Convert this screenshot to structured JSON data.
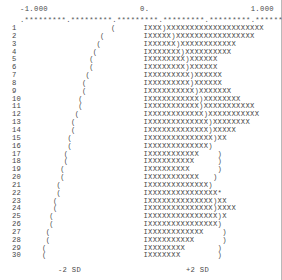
{
  "plot": {
    "type": "ascii-confidence-interval-plot",
    "row_count": 30,
    "char_unit_px": 3.62,
    "scale": {
      "left_label": "-1.000",
      "center_label": "0.",
      "right_label": "1.000",
      "axis_ruler": ".*********.*********.*********.*********.*********.*********.",
      "min": -1.0,
      "max": 1.0,
      "center": 0.0
    },
    "footer": {
      "left_label": "-2 SD",
      "right_label": "+2 SD"
    },
    "glyphs": {
      "bar_fill": "X",
      "bar_start": "I",
      "upper_bound": ")",
      "lower_bound": "(",
      "outlier_marker": "*",
      "ruler_tick": "*",
      "ruler_major": "."
    },
    "rows": [
      {
        "n": "1",
        "paren_col": 24,
        "bar": "IXXX)XXXXXXXXXXXXXXXXXXXXX"
      },
      {
        "n": "2",
        "paren_col": 21,
        "bar": "IXXXXX)XXXXXXXXXXXXXXXXX"
      },
      {
        "n": "3",
        "paren_col": 20,
        "bar": "IXXXXXX)XXXXXXXXXXXX"
      },
      {
        "n": "4",
        "paren_col": 19,
        "bar": "IXXXXXXX)XXXXXXXXXX"
      },
      {
        "n": "5",
        "paren_col": 18,
        "bar": "IXXXXXXXX)XXXXXX"
      },
      {
        "n": "6",
        "paren_col": 18,
        "bar": "IXXXXXXXX)XXXXXX"
      },
      {
        "n": "7",
        "paren_col": 17,
        "bar": "IXXXXXXXXX)XXXXXX"
      },
      {
        "n": "8",
        "paren_col": 16,
        "bar": "IXXXXXXXXX)XXXXXX"
      },
      {
        "n": "9",
        "paren_col": 16,
        "bar": "IXXXXXXXXXX)XXXXXXX"
      },
      {
        "n": "10",
        "paren_col": 15,
        "bar": "IXXXXXXXXXXX)XXXXXXXX"
      },
      {
        "n": "11",
        "paren_col": 15,
        "bar": "IXXXXXXXXXXX)XXXXXXXXXXX"
      },
      {
        "n": "12",
        "paren_col": 14,
        "bar": "IXXXXXXXXXXXX)XXXXXXXXXXX"
      },
      {
        "n": "13",
        "paren_col": 13,
        "bar": "IXXXXXXXXXXXXX)XXXXXXXX"
      },
      {
        "n": "14",
        "paren_col": 13,
        "bar": "IXXXXXXXXXXXXX)XXXXX"
      },
      {
        "n": "15",
        "paren_col": 12,
        "bar": "IXXXXXXXXXXXXXX)XX"
      },
      {
        "n": "16",
        "paren_col": 12,
        "bar": "IXXXXXXXXXXXXX)"
      },
      {
        "n": "17",
        "paren_col": 11,
        "bar": "IXXXXXXXXXXX    )"
      },
      {
        "n": "18",
        "paren_col": 11,
        "bar": "IXXXXXXXXXX     )"
      },
      {
        "n": "19",
        "paren_col": 10,
        "bar": "IXXXXXXXXX      )"
      },
      {
        "n": "20",
        "paren_col": 10,
        "bar": "IXXXXXXXXXXX   )"
      },
      {
        "n": "21",
        "paren_col": 9,
        "bar": "IXXXXXXXXXXXXX)"
      },
      {
        "n": "22",
        "paren_col": 9,
        "bar": "IXXXXXXXXXXXXXXX*"
      },
      {
        "n": "23",
        "paren_col": 8,
        "bar": "IXXXXXXXXXXXXXX)XX"
      },
      {
        "n": "24",
        "paren_col": 8,
        "bar": "IXXXXXXXXXXXXXX)XXXX"
      },
      {
        "n": "25",
        "paren_col": 7,
        "bar": "IXXXXXXXXXXXXXXX)X"
      },
      {
        "n": "26",
        "paren_col": 7,
        "bar": "IXXXXXXXXXXXXXXX)"
      },
      {
        "n": "27",
        "paren_col": 6,
        "bar": "IXXXXXXXXXXXX    )"
      },
      {
        "n": "28",
        "paren_col": 6,
        "bar": "IXXXXXXXXXX      )"
      },
      {
        "n": "29",
        "paren_col": 5,
        "bar": "IXXXXXXXX       )"
      },
      {
        "n": "30",
        "paren_col": 5,
        "bar": "IXXXXXXX        )"
      }
    ]
  },
  "chart_data": {
    "type": "line",
    "title": "",
    "subtitle": "",
    "xlabel": "",
    "ylabel": "",
    "xlim": [
      -1.0,
      1.0
    ],
    "ylim": [
      1,
      30
    ],
    "grid": false,
    "legend": null,
    "x_tick_labels": [
      "-1.000",
      "0.",
      "1.000"
    ],
    "annotations": [
      "-2 SD",
      "+2 SD"
    ],
    "categories": [
      "1",
      "2",
      "3",
      "4",
      "5",
      "6",
      "7",
      "8",
      "9",
      "10",
      "11",
      "12",
      "13",
      "14",
      "15",
      "16",
      "17",
      "18",
      "19",
      "20",
      "21",
      "22",
      "23",
      "24",
      "25",
      "26",
      "27",
      "28",
      "29",
      "30"
    ],
    "series": [
      {
        "name": "lower-bound",
        "values": [
          -0.205,
          -0.279,
          -0.304,
          -0.33,
          -0.355,
          -0.355,
          -0.38,
          -0.406,
          -0.406,
          -0.431,
          -0.431,
          -0.456,
          -0.482,
          -0.482,
          -0.507,
          -0.507,
          -0.532,
          -0.532,
          -0.558,
          -0.558,
          -0.583,
          -0.583,
          -0.608,
          -0.608,
          -0.634,
          -0.634,
          -0.659,
          -0.659,
          -0.684,
          -0.684
        ]
      },
      {
        "name": "upper-bound",
        "values": [
          -0.102,
          -0.152,
          -0.177,
          -0.203,
          -0.228,
          -0.228,
          -0.228,
          -0.254,
          -0.254,
          -0.254,
          -0.254,
          -0.254,
          -0.254,
          -0.254,
          -0.254,
          -0.279,
          -0.254,
          -0.279,
          -0.304,
          -0.279,
          -0.254,
          -0.228,
          -0.254,
          -0.254,
          -0.254,
          -0.254,
          -0.355,
          -0.406,
          -0.456,
          -0.482
        ]
      }
    ]
  }
}
